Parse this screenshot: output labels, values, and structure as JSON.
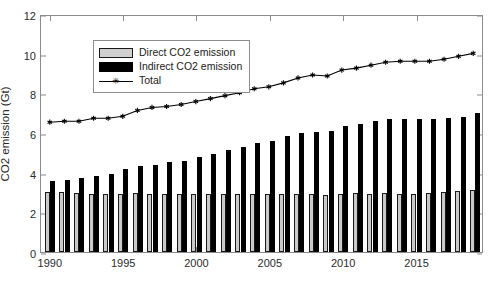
{
  "chart_data": {
    "type": "bar",
    "title": "",
    "xlabel": "",
    "ylabel": "CO2 emission (Gt)",
    "ylim": [
      0,
      12
    ],
    "xlim": [
      1989.4,
      2019.6
    ],
    "yticks": [
      0,
      2,
      4,
      6,
      8,
      10,
      12
    ],
    "xticks": [
      1990,
      1995,
      2000,
      2005,
      2010,
      2015
    ],
    "grid": false,
    "legend_position": "upper left",
    "categories": [
      1990,
      1991,
      1992,
      1993,
      1994,
      1995,
      1996,
      1997,
      1998,
      1999,
      2000,
      2001,
      2002,
      2003,
      2004,
      2005,
      2006,
      2007,
      2008,
      2009,
      2010,
      2011,
      2012,
      2013,
      2014,
      2015,
      2016,
      2017,
      2018,
      2019
    ],
    "series": [
      {
        "name": "Direct CO2 emission",
        "type": "bar",
        "color": "#c9c9c9",
        "values": [
          3.05,
          3.05,
          3.0,
          2.95,
          2.95,
          2.95,
          3.0,
          2.95,
          2.9,
          2.9,
          2.9,
          2.9,
          2.9,
          2.95,
          2.95,
          2.9,
          2.9,
          2.9,
          2.9,
          2.85,
          2.95,
          3.0,
          2.95,
          3.0,
          2.95,
          2.9,
          3.0,
          3.05,
          3.1,
          3.15
        ]
      },
      {
        "name": "Indirect CO2 emission",
        "type": "bar",
        "color": "#000000",
        "values": [
          3.6,
          3.65,
          3.75,
          3.85,
          3.95,
          4.2,
          4.35,
          4.4,
          4.55,
          4.6,
          4.8,
          4.95,
          5.15,
          5.3,
          5.5,
          5.6,
          5.85,
          6.0,
          6.05,
          6.1,
          6.35,
          6.45,
          6.6,
          6.7,
          6.7,
          6.7,
          6.7,
          6.75,
          6.8,
          7.0
        ]
      },
      {
        "name": "Total",
        "type": "line",
        "color": "#000000",
        "marker": "asterisk",
        "values": [
          6.6,
          6.65,
          6.65,
          6.8,
          6.8,
          6.9,
          7.2,
          7.35,
          7.4,
          7.5,
          7.65,
          7.8,
          7.95,
          8.1,
          8.3,
          8.4,
          8.6,
          8.85,
          9.0,
          8.95,
          9.25,
          9.35,
          9.5,
          9.65,
          9.7,
          9.7,
          9.7,
          9.8,
          9.95,
          10.1
        ]
      }
    ]
  },
  "legend": {
    "items": [
      {
        "label": "Direct CO2 emission",
        "key": "swatch-direct"
      },
      {
        "label": "Indirect CO2 emission",
        "key": "swatch-indirect"
      },
      {
        "label": "Total",
        "key": "line-marker-total"
      }
    ]
  },
  "axes": {
    "ylabel": "CO2 emission (Gt)",
    "ytick_labels": [
      "0",
      "2",
      "4",
      "6",
      "8",
      "10",
      "12"
    ],
    "xtick_labels": [
      "1990",
      "1995",
      "2000",
      "2005",
      "2010",
      "2015"
    ]
  }
}
